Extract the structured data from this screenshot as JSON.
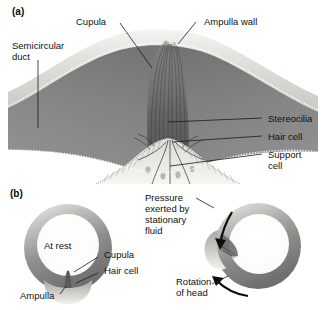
{
  "figure": {
    "panels": [
      {
        "letter": "(a)",
        "caption": "Cross-section through the ampulla showing the cupula and crista"
      },
      {
        "letter": "(b)",
        "caption": "Cupula at rest and during rotation of the head"
      }
    ]
  },
  "panel_a": {
    "letter": "(a)",
    "labels": {
      "semicircular_duct": "Semicircular\nduct",
      "cupula": "Cupula",
      "ampulla_wall": "Ampulla wall",
      "stereocilia": "Stereocilia",
      "hair_cell": "Hair cell",
      "support_cell": "Support\ncell"
    }
  },
  "panel_b": {
    "letter": "(b)",
    "labels": {
      "at_rest": "At rest",
      "ampulla": "Ampulla",
      "cupula": "Cupula",
      "hair_cell": "Hair cell",
      "pressure": "Pressure\nexerted by\nstationary\nfluid",
      "rotation": "Rotation\nof head"
    }
  },
  "colors": {
    "text": "#111111",
    "leader": "#1a1a1a",
    "duct_interior_dark": "#7c7c7c",
    "duct_interior_mid": "#8e8e8e",
    "wall_light": "#d8d8d4",
    "wall_highlight": "#efeeea",
    "epithelium": "#e3e2dc",
    "cupula_gray": "#6e6e6e",
    "ring_dark": "#8a8a88",
    "ring_light": "#d5d5d1",
    "background": "#ffffff"
  }
}
